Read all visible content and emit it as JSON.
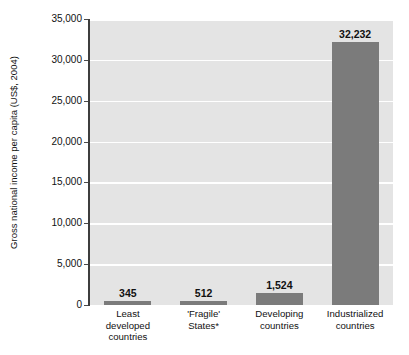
{
  "chart_data": {
    "type": "bar",
    "title": "",
    "xlabel": "",
    "ylabel": "Gross national income per capita (US$, 2004)",
    "categories": [
      "Least developed countries",
      "'Fragile' States*",
      "Developing countries",
      "Industrialized countries"
    ],
    "category_lines": [
      [
        "Least",
        "developed",
        "countries"
      ],
      [
        "'Fragile'",
        "States*"
      ],
      [
        "Developing",
        "countries"
      ],
      [
        "Industrialized",
        "countries"
      ]
    ],
    "values": [
      345,
      512,
      1524,
      32232
    ],
    "value_labels": [
      "345",
      "512",
      "1,524",
      "32,232"
    ],
    "ylim": [
      0,
      35000
    ],
    "ytick_values": [
      0,
      5000,
      10000,
      15000,
      20000,
      25000,
      30000,
      35000
    ],
    "ytick_labels": [
      "0",
      "5,000",
      "10,000",
      "15,000",
      "20,000",
      "25,000",
      "30,000",
      "35,000"
    ],
    "grid": true,
    "grid_color": "#ffffff",
    "legend": null,
    "bar_color": "#7b7b7b",
    "plot_background": "#e4e4e4",
    "axis_color": "#3d3d3d",
    "text_color": "#111111"
  }
}
